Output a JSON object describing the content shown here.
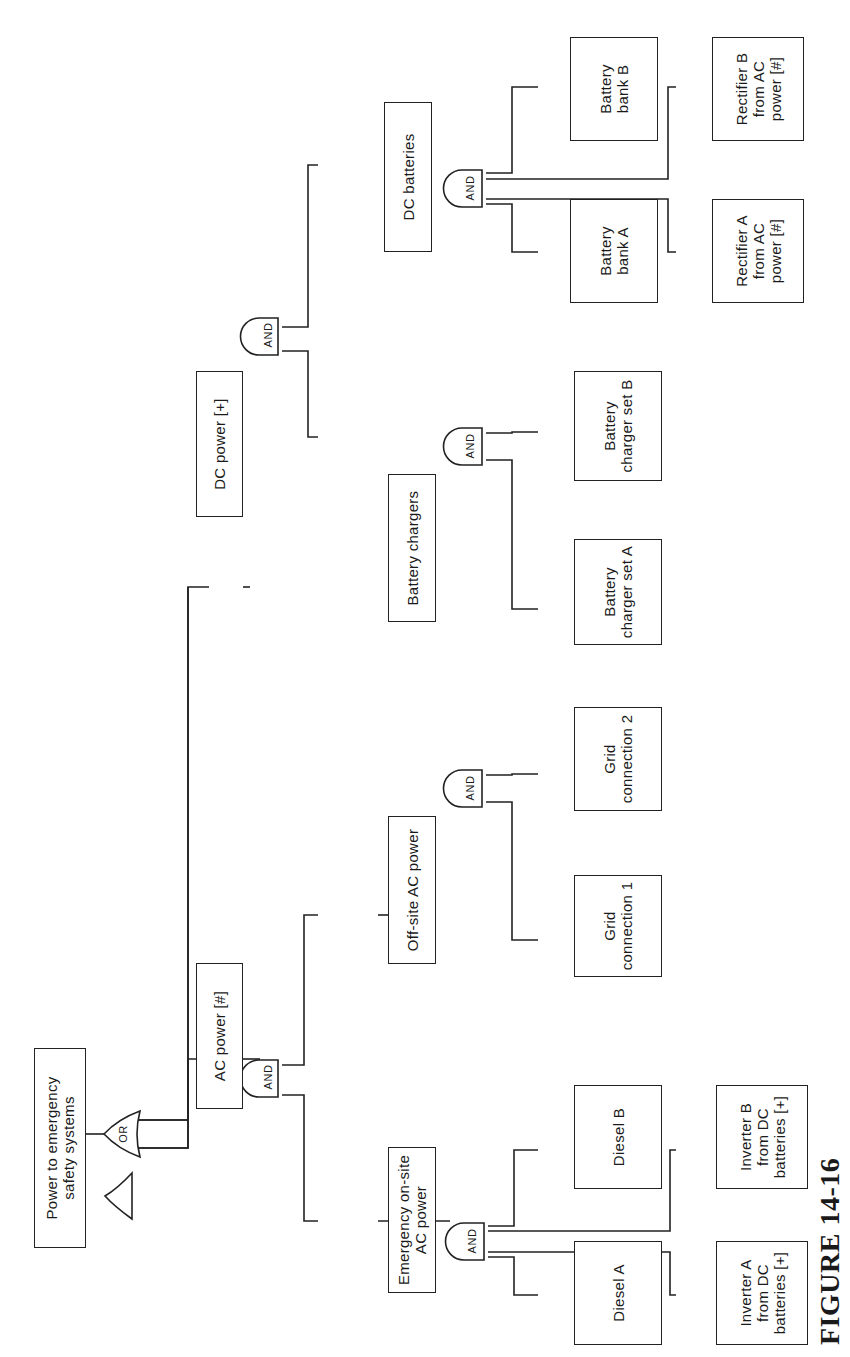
{
  "figure": {
    "caption": "FIGURE 14-16",
    "type": "fault-tree",
    "orientation": "rotated-90-ccw"
  },
  "nodes": {
    "top": "Power to emergency\nsafety systems",
    "ac_power": "AC power [#]",
    "dc_power": "DC power [+]",
    "emergency_onsite": "Emergency on-site\nAC power",
    "offsite_ac": "Off-site AC power",
    "battery_chargers": "Battery chargers",
    "dc_batteries": "DC batteries",
    "diesel_a": "Diesel A",
    "diesel_b": "Diesel B",
    "inverter_a": "Inverter A\nfrom DC\nbatteries [+]",
    "inverter_b": "Inverter B\nfrom DC\nbatteries [+]",
    "grid_1": "Grid\nconnection 1",
    "grid_2": "Grid\nconnection 2",
    "charger_a": "Battery\ncharger set A",
    "charger_b": "Battery\ncharger set B",
    "bank_a": "Battery\nbank A",
    "bank_b": "Battery\nbank B",
    "rectifier_a": "Rectifier A\nfrom AC\npower [#]",
    "rectifier_b": "Rectifier B\nfrom AC\npower [#]"
  },
  "gates": {
    "or_top": "OR",
    "and_ac": "AND",
    "and_dc": "AND",
    "and_emergency": "AND",
    "and_offsite": "AND",
    "and_chargers": "AND",
    "and_batteries": "AND"
  }
}
